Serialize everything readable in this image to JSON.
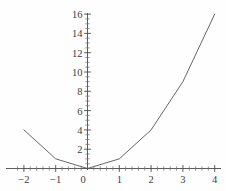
{
  "chart_data": {
    "type": "line",
    "title": "",
    "subtitle": "",
    "xlabel": "",
    "ylabel": "",
    "x": [
      -2,
      -1,
      0,
      1,
      2,
      3,
      4
    ],
    "values": [
      4,
      1,
      0,
      1,
      4,
      9,
      16
    ],
    "series": [
      {
        "name": "y = x^2",
        "x": [
          -2,
          -1,
          0,
          1,
          2,
          3,
          4
        ],
        "values": [
          4,
          1,
          0,
          1,
          4,
          9,
          16
        ]
      }
    ],
    "xlim": [
      -2.3,
      4.35
    ],
    "ylim": [
      -0.6,
      16.9
    ],
    "x_ticks": [
      -2,
      -1,
      0,
      1,
      2,
      3,
      4
    ],
    "x_tick_labels": [
      "−2",
      "−1",
      "0",
      "1",
      "2",
      "3",
      "4"
    ],
    "y_ticks": [
      2,
      4,
      6,
      8,
      10,
      12,
      14,
      16
    ],
    "y_tick_labels": [
      "2",
      "4",
      "6",
      "8",
      "10",
      "12",
      "14",
      "16"
    ],
    "x_minor_step": 0.2,
    "y_minor_step": 0.5,
    "origin_label": "0",
    "grid": false,
    "legend": null,
    "legend_position": "none",
    "annotations": [],
    "line_color": "#555555",
    "axis_color": "#4a4a4a",
    "background_color": "#fefefe"
  }
}
